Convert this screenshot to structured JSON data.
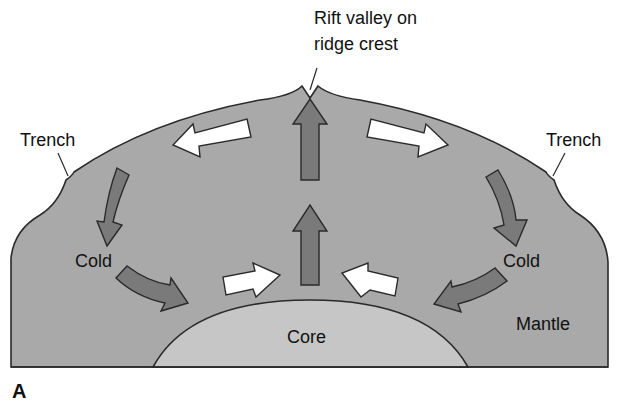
{
  "figure": {
    "panel_label": "A"
  },
  "labels": {
    "rift": [
      "Rift valley on",
      "ridge crest"
    ],
    "trench_left": "Trench",
    "trench_right": "Trench",
    "cold_left": "Cold",
    "cold_right": "Cold",
    "core": "Core",
    "mantle": "Mantle"
  },
  "colors": {
    "mantle_fill": "#a9a9a9",
    "core_fill": "#c6c6c6",
    "hot_arrow_fill": "#7a7a7a",
    "cold_arrow_fill": "#ffffff",
    "outline": "#2a2a2a",
    "background": "#ffffff"
  },
  "arrows": [
    {
      "id": "rising-upper",
      "type": "hot",
      "direction": "up"
    },
    {
      "id": "rising-lower",
      "type": "hot",
      "direction": "up"
    },
    {
      "id": "spread-left",
      "type": "cold",
      "direction": "left"
    },
    {
      "id": "spread-right",
      "type": "cold",
      "direction": "right"
    },
    {
      "id": "sink-left-upper",
      "type": "hot",
      "direction": "down"
    },
    {
      "id": "sink-right-upper",
      "type": "hot",
      "direction": "down"
    },
    {
      "id": "sink-left-lower",
      "type": "hot",
      "direction": "right-down"
    },
    {
      "id": "sink-right-lower",
      "type": "hot",
      "direction": "left-down"
    },
    {
      "id": "converge-left",
      "type": "cold",
      "direction": "right"
    },
    {
      "id": "converge-right",
      "type": "cold",
      "direction": "left"
    }
  ]
}
